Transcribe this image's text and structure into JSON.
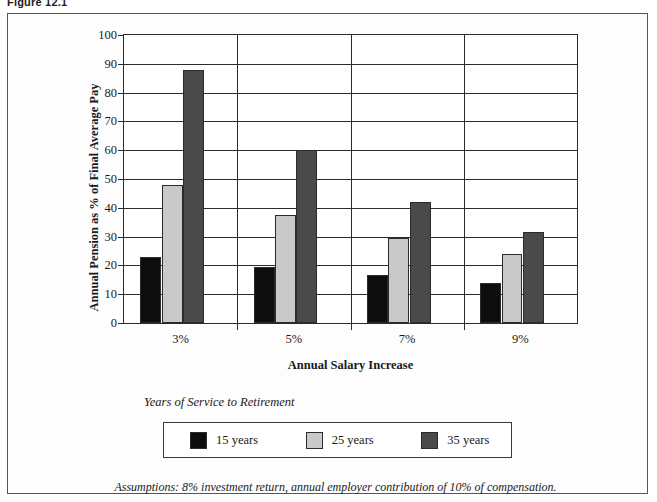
{
  "figure": {
    "caption": "Figure 12.1",
    "footnote": "Assumptions: 8% investment return, annual employer contribution of 10% of compensation."
  },
  "legend": {
    "title": "Years of Service to Retirement"
  },
  "colors": {
    "series_15_years": "#0d0d0d",
    "series_25_years": "#c9c9c9",
    "series_35_years": "#4a4a4a",
    "axis": "#2b2b2b",
    "plot_background": "#ffffff",
    "frame_background": "#fdfdfd"
  },
  "chart_data": {
    "type": "bar",
    "title": "",
    "xlabel": "Annual Salary Increase",
    "ylabel": "Annual Pension as % of Final Average Pay",
    "categories": [
      "3%",
      "5%",
      "7%",
      "9%"
    ],
    "ylim": [
      0,
      100
    ],
    "yticks": [
      0,
      10,
      20,
      30,
      40,
      50,
      60,
      70,
      80,
      90,
      100
    ],
    "ytick_labels": [
      "0",
      "10",
      "20",
      "30",
      "40",
      "50",
      "60",
      "70",
      "80",
      "90",
      "100"
    ],
    "grid": "horizontal-and-vertical",
    "legend_position": "below-plot",
    "series": [
      {
        "name": "15 years",
        "color": "#0d0d0d",
        "values": [
          23,
          19.5,
          16.5,
          14
        ]
      },
      {
        "name": "25 years",
        "color": "#c9c9c9",
        "values": [
          48,
          37.5,
          29.5,
          24
        ]
      },
      {
        "name": "35 years",
        "color": "#4a4a4a",
        "values": [
          88,
          60,
          42,
          31.5
        ]
      }
    ]
  }
}
